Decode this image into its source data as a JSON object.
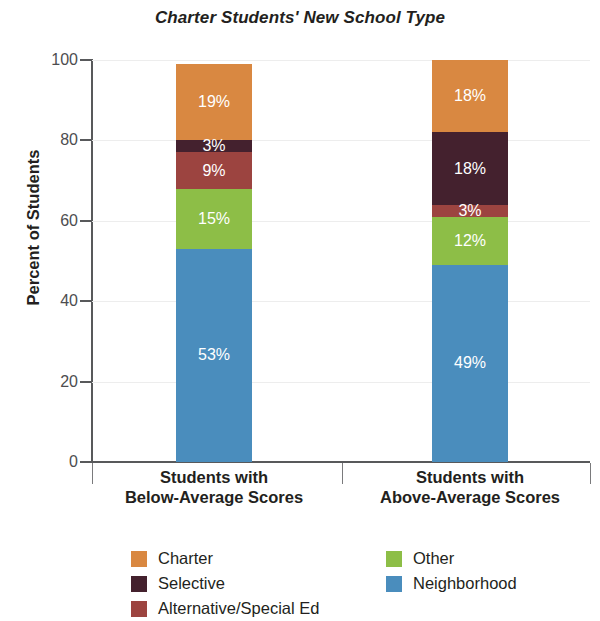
{
  "chart_data": {
    "type": "bar",
    "stacked": true,
    "stack_total": 100,
    "title": "Charter Students' New School Type",
    "xlabel": "",
    "ylabel": "Percent of Students",
    "ylim": [
      0,
      100
    ],
    "yticks": [
      0,
      20,
      40,
      60,
      80,
      100
    ],
    "ytick_labels": [
      "0",
      "20",
      "40",
      "60",
      "80",
      "100"
    ],
    "grid": true,
    "legend_position": "bottom",
    "categories": [
      "Students with\nBelow-Average Scores",
      "Students with\nAbove-Average Scores"
    ],
    "category_lines": [
      [
        "Students with",
        "Below-Average Scores"
      ],
      [
        "Students with",
        "Above-Average Scores"
      ]
    ],
    "series": [
      {
        "name": "Neighborhood",
        "color": "#4a8dbd",
        "values": [
          53,
          49
        ],
        "labels": [
          "53%",
          "49%"
        ]
      },
      {
        "name": "Other",
        "color": "#8dbe47",
        "values": [
          15,
          12
        ],
        "labels": [
          "15%",
          "12%"
        ]
      },
      {
        "name": "Alternative/Special Ed",
        "color": "#9c4440",
        "values": [
          9,
          3
        ],
        "labels": [
          "9%",
          "3%"
        ]
      },
      {
        "name": "Selective",
        "color": "#44212e",
        "values": [
          3,
          18
        ],
        "labels": [
          "3%",
          "18%"
        ]
      },
      {
        "name": "Charter",
        "color": "#d98841",
        "values": [
          19,
          18
        ],
        "labels": [
          "19%",
          "18%"
        ]
      }
    ],
    "legend_columns": [
      [
        {
          "label": "Charter",
          "color": "#d98841"
        },
        {
          "label": "Selective",
          "color": "#44212e"
        },
        {
          "label": "Alternative/Special Ed",
          "color": "#9c4440"
        }
      ],
      [
        {
          "label": "Other",
          "color": "#8dbe47"
        },
        {
          "label": "Neighborhood",
          "color": "#4a8dbd"
        }
      ]
    ]
  }
}
